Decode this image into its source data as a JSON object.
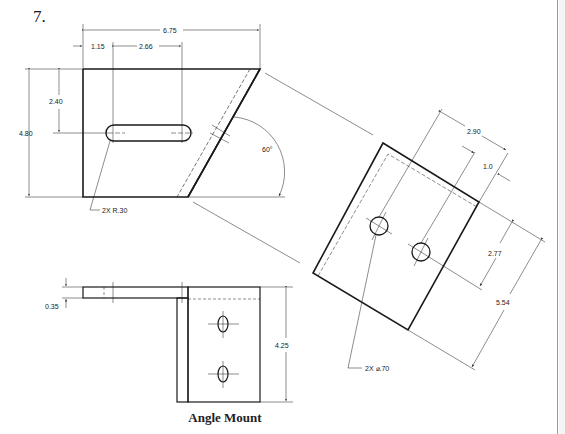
{
  "problem_number": "7.",
  "caption": "Angle Mount",
  "front_view": {
    "dims": {
      "overall_width": "6.75",
      "slot_offset": "1.15",
      "slot_length": "2.66",
      "slot_height_from_bottom": "2.40",
      "overall_height": "4.80",
      "angle": "60°",
      "slot_radius_note": "2X R.30"
    }
  },
  "auxiliary_view": {
    "dims": {
      "hole_spacing_width": "2.90",
      "edge_offset": "1.0",
      "hole_offset": "2.77",
      "overall_length": "5.54",
      "hole_note": "2X ⌀.70"
    }
  },
  "bottom_view": {
    "dims": {
      "thickness": "0.35",
      "height": "4.25"
    }
  },
  "colors": {
    "line": "#1a1a1a",
    "border": "#9a9a9a"
  }
}
